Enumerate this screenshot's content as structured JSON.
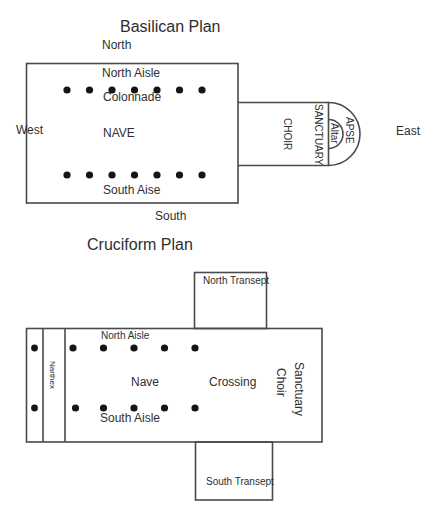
{
  "basilican": {
    "title": "Basilican Plan",
    "compass": {
      "north": "North",
      "south": "South",
      "west": "West",
      "east": "East"
    },
    "labels": {
      "north_aisle": "North Aisle",
      "colonnade": "Colonnade",
      "nave": "NAVE",
      "south_aisle": "South Aise",
      "choir": "CHOIR",
      "sanctuary": "SANCTUARY",
      "apse": "APSE",
      "altar": "Altar"
    },
    "columns_per_row": 7
  },
  "cruciform": {
    "title": "Cruciform Plan",
    "labels": {
      "north_transept": "North Transept",
      "south_transept": "South Transept",
      "north_aisle": "North Aisle",
      "south_aisle": "South Aisle",
      "narthex": "Narthex",
      "nave": "Nave",
      "crossing": "Crossing",
      "sanctuary": "Sanctuary",
      "choir": "Choir"
    },
    "columns_per_row": 5,
    "narthex_columns": 2
  }
}
